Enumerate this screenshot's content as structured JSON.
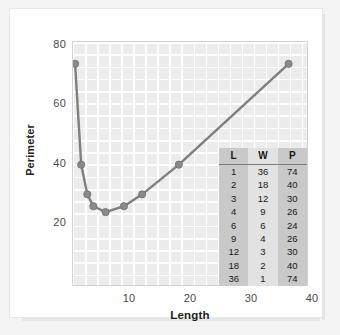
{
  "chart_data": {
    "type": "line",
    "title": "",
    "xlabel": "Length",
    "ylabel": "Perimeter",
    "xlim": [
      0,
      40
    ],
    "ylim": [
      10,
      80
    ],
    "grid": true,
    "legend": "none",
    "marker": "circle",
    "line_color": "#7f7f7f",
    "marker_color": "#8a8a8a",
    "plot_bg": "#ececec",
    "grid_color": "#ffffff",
    "x": [
      1,
      2,
      3,
      4,
      6,
      9,
      12,
      18,
      36
    ],
    "y": [
      74,
      40,
      30,
      26,
      24,
      26,
      30,
      40,
      74
    ],
    "points": [
      {
        "x": 1,
        "y": 74
      },
      {
        "x": 2,
        "y": 40
      },
      {
        "x": 3,
        "y": 30
      },
      {
        "x": 4,
        "y": 26
      },
      {
        "x": 6,
        "y": 24
      },
      {
        "x": 9,
        "y": 26
      },
      {
        "x": 12,
        "y": 30
      },
      {
        "x": 18,
        "y": 40
      },
      {
        "x": 36,
        "y": 74
      }
    ],
    "xticks": [
      "10",
      "20",
      "30",
      "40"
    ],
    "xtick_values": [
      10,
      20,
      30,
      40
    ],
    "yticks": [
      "20",
      "40",
      "60",
      "80"
    ],
    "ytick_values": [
      20,
      40,
      60,
      80
    ]
  },
  "data_table": {
    "headers": [
      "L",
      "W",
      "P"
    ],
    "rows": [
      [
        "1",
        "36",
        "74"
      ],
      [
        "2",
        "18",
        "40"
      ],
      [
        "3",
        "12",
        "30"
      ],
      [
        "4",
        "9",
        "26"
      ],
      [
        "6",
        "6",
        "24"
      ],
      [
        "9",
        "4",
        "26"
      ],
      [
        "12",
        "3",
        "30"
      ],
      [
        "18",
        "2",
        "40"
      ],
      [
        "36",
        "1",
        "74"
      ]
    ]
  }
}
